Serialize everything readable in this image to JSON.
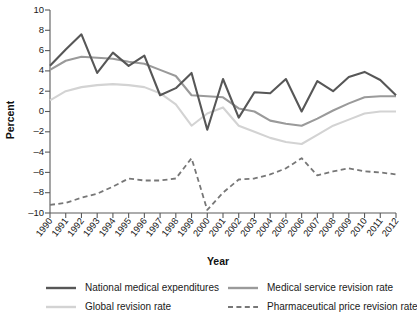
{
  "chart_data": {
    "type": "line",
    "title": "",
    "xlabel": "Year",
    "ylabel": "Percent",
    "ylim": [
      -10,
      10
    ],
    "ytick_step": 2,
    "yticks": [
      10,
      8,
      6,
      4,
      2,
      0,
      -2,
      -4,
      -6,
      -8,
      -10
    ],
    "grid": false,
    "legend_position": "bottom",
    "categories": [
      "1990",
      "1991",
      "1992",
      "1993",
      "1994",
      "1995",
      "1996",
      "1997",
      "1998",
      "1999",
      "2000",
      "2001",
      "2002",
      "2003",
      "2004",
      "2005",
      "2006",
      "2007",
      "2008",
      "2009",
      "2010",
      "2011",
      "2012"
    ],
    "series": [
      {
        "name": "National medical expenditures",
        "color": "#575757",
        "style": "solid",
        "width": 2.1,
        "values": [
          4.5,
          6.1,
          7.6,
          3.8,
          5.8,
          4.5,
          5.5,
          1.6,
          2.3,
          3.8,
          -1.8,
          3.2,
          -0.6,
          1.9,
          1.8,
          3.2,
          0.0,
          3.0,
          2.0,
          3.4,
          3.9,
          3.1,
          1.6
        ]
      },
      {
        "name": "Medical service revision rate",
        "color": "#9a9a9a",
        "style": "solid",
        "width": 2.1,
        "values": [
          4.1,
          5.0,
          5.4,
          5.3,
          5.2,
          4.9,
          4.7,
          4.1,
          3.5,
          1.6,
          1.5,
          1.4,
          0.3,
          0.0,
          -0.9,
          -1.2,
          -1.4,
          -0.7,
          0.1,
          0.8,
          1.4,
          1.5,
          1.5
        ]
      },
      {
        "name": "Global revision rate",
        "color": "#d3d3d3",
        "style": "solid",
        "width": 2.1,
        "values": [
          1.1,
          2.0,
          2.4,
          2.6,
          2.7,
          2.6,
          2.4,
          1.8,
          0.7,
          -1.4,
          -0.2,
          0.4,
          -1.4,
          -2.0,
          -2.6,
          -3.0,
          -3.2,
          -2.3,
          -1.4,
          -0.8,
          -0.2,
          0.0,
          0.0
        ]
      },
      {
        "name": "Pharmaceutical price revision rate",
        "color": "#777777",
        "style": "dashed",
        "width": 1.8,
        "values": [
          -9.2,
          -9.0,
          -8.5,
          -8.1,
          -7.4,
          -6.6,
          -6.8,
          -6.8,
          -6.6,
          -4.6,
          -9.7,
          -8.0,
          -6.7,
          -6.6,
          -6.2,
          -5.6,
          -4.6,
          -6.3,
          -5.9,
          -5.6,
          -5.9,
          -6.0,
          -6.2
        ]
      }
    ]
  },
  "legend": {
    "entries": [
      {
        "label": "National medical expenditures",
        "color": "#575757",
        "style": "solid"
      },
      {
        "label": "Medical service revision rate",
        "color": "#9a9a9a",
        "style": "solid"
      },
      {
        "label": "Global revision rate",
        "color": "#d3d3d3",
        "style": "solid"
      },
      {
        "label": "Pharmaceutical price revision rate",
        "color": "#777777",
        "style": "dashed"
      }
    ]
  }
}
